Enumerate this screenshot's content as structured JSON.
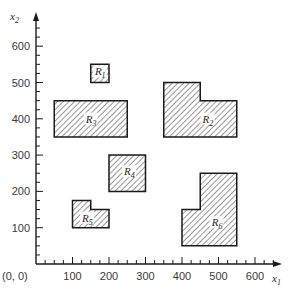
{
  "figure": {
    "x_axis": {
      "label": "x",
      "label_sub": "1",
      "range": [
        0,
        620
      ],
      "major_ticks": [
        100,
        200,
        300,
        400,
        500,
        600
      ],
      "minor_step": 25,
      "tick_labels": [
        "100",
        "200",
        "300",
        "400",
        "500",
        "600"
      ],
      "origin_label": "(0, 0)"
    },
    "y_axis": {
      "label": "x",
      "label_sub": "2",
      "range": [
        0,
        690
      ],
      "major_ticks": [
        100,
        200,
        300,
        400,
        500,
        600
      ],
      "minor_step": 25,
      "tick_labels": [
        "100",
        "200",
        "300",
        "400",
        "500",
        "600"
      ]
    },
    "regions": [
      {
        "name": "R",
        "sub": "1",
        "label_at": [
          175,
          525
        ],
        "polygon": [
          [
            150,
            500
          ],
          [
            200,
            500
          ],
          [
            200,
            550
          ],
          [
            150,
            550
          ]
        ]
      },
      {
        "name": "R",
        "sub": "2",
        "label_at": [
          470,
          395
        ],
        "polygon": [
          [
            350,
            350
          ],
          [
            550,
            350
          ],
          [
            550,
            450
          ],
          [
            450,
            450
          ],
          [
            450,
            500
          ],
          [
            350,
            500
          ]
        ]
      },
      {
        "name": "R",
        "sub": "3",
        "label_at": [
          150,
          395
        ],
        "polygon": [
          [
            50,
            350
          ],
          [
            250,
            350
          ],
          [
            250,
            450
          ],
          [
            50,
            450
          ]
        ]
      },
      {
        "name": "R",
        "sub": "4",
        "label_at": [
          255,
          250
        ],
        "polygon": [
          [
            200,
            200
          ],
          [
            300,
            200
          ],
          [
            300,
            300
          ],
          [
            200,
            300
          ]
        ]
      },
      {
        "name": "R",
        "sub": "5",
        "label_at": [
          140,
          122
        ],
        "polygon": [
          [
            100,
            100
          ],
          [
            200,
            100
          ],
          [
            200,
            150
          ],
          [
            150,
            150
          ],
          [
            150,
            175
          ],
          [
            100,
            175
          ]
        ]
      },
      {
        "name": "R",
        "sub": "6",
        "label_at": [
          495,
          110
        ],
        "polygon": [
          [
            400,
            50
          ],
          [
            550,
            50
          ],
          [
            550,
            250
          ],
          [
            450,
            250
          ],
          [
            450,
            150
          ],
          [
            400,
            150
          ]
        ]
      }
    ],
    "colors": {
      "ink": "#1a1a1a",
      "hatch": "#333333",
      "background": "#ffffff"
    }
  }
}
